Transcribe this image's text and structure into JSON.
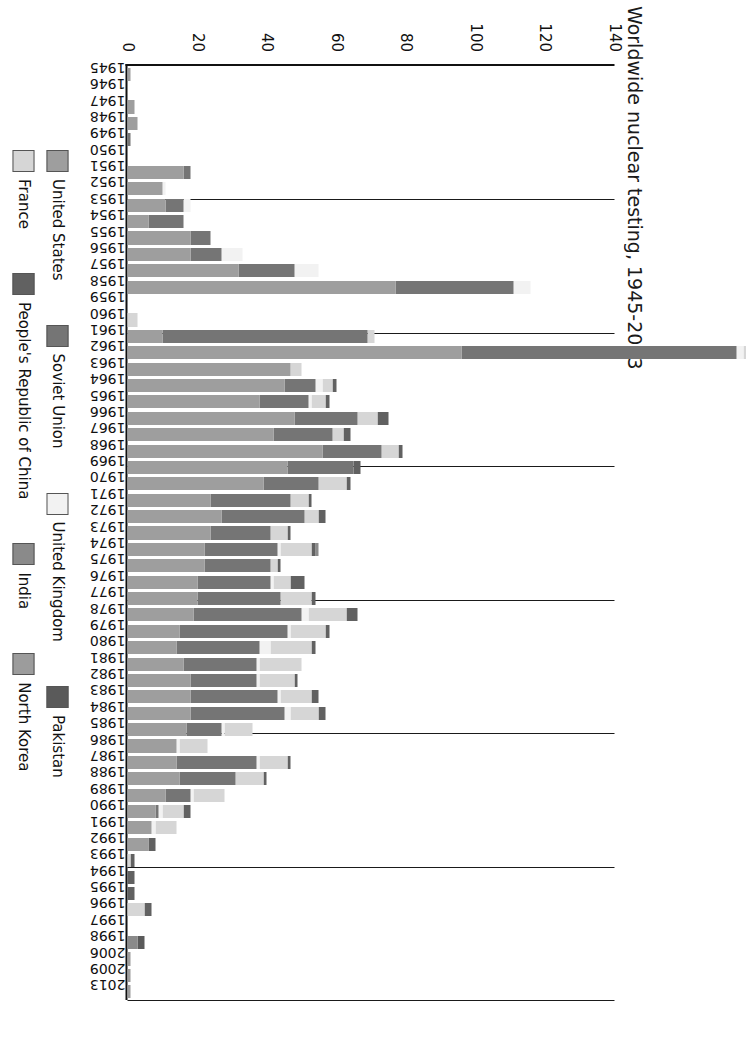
{
  "chart_data": {
    "type": "bar",
    "title": "Worldwide nuclear testing, 1945-2013",
    "subtitle": "",
    "xlabel": "",
    "ylabel": "",
    "ylim": [
      0,
      140
    ],
    "yticks": [
      0,
      20,
      40,
      60,
      80,
      100,
      120,
      140
    ],
    "ytick_labels": [
      "0",
      "20",
      "40",
      "60",
      "80",
      "100",
      "120",
      "140"
    ],
    "grid": true,
    "stacked": true,
    "orientation": "rotated-90-clockwise",
    "legend_position": "bottom",
    "legend": [
      "United States",
      "Soviet Union",
      "United Kingdom",
      "Pakistan",
      "France",
      "People's Republic of China",
      "India",
      "North Korea"
    ],
    "series_colors": {
      "United States": "#9e9e9e",
      "Soviet Union": "#757575",
      "United Kingdom": "#f2f2f2",
      "Pakistan": "#5a5a5a",
      "France": "#d6d6d6",
      "People's Republic of China": "#616161",
      "India": "#8a8a8a",
      "North Korea": "#9c9c9c"
    },
    "categories": [
      "1945",
      "1946",
      "1947",
      "1948",
      "1949",
      "1950",
      "1951",
      "1952",
      "1953",
      "1954",
      "1955",
      "1956",
      "1957",
      "1958",
      "1959",
      "1960",
      "1961",
      "1962",
      "1963",
      "1964",
      "1965",
      "1966",
      "1967",
      "1968",
      "1969",
      "1970",
      "1971",
      "1972",
      "1973",
      "1974",
      "1975",
      "1976",
      "1977",
      "1978",
      "1979",
      "1980",
      "1981",
      "1982",
      "1983",
      "1984",
      "1985",
      "1986",
      "1987",
      "1988",
      "1989",
      "1990",
      "1991",
      "1992",
      "1993",
      "1994",
      "1995",
      "1996",
      "1997",
      "1998",
      "2006",
      "2009",
      "2013"
    ],
    "series": [
      {
        "name": "United States",
        "values": [
          1,
          0,
          2,
          3,
          0,
          0,
          16,
          10,
          11,
          6,
          18,
          18,
          32,
          77,
          0,
          0,
          10,
          96,
          47,
          45,
          38,
          48,
          42,
          56,
          46,
          39,
          24,
          27,
          24,
          22,
          22,
          20,
          20,
          19,
          15,
          14,
          16,
          18,
          18,
          18,
          17,
          14,
          14,
          15,
          11,
          8,
          7,
          6,
          0,
          0,
          0,
          0,
          0,
          0,
          0,
          0,
          0
        ]
      },
      {
        "name": "Soviet Union",
        "values": [
          0,
          0,
          0,
          0,
          1,
          0,
          2,
          0,
          5,
          10,
          6,
          9,
          16,
          34,
          0,
          0,
          59,
          79,
          0,
          9,
          14,
          18,
          17,
          17,
          19,
          16,
          23,
          24,
          17,
          21,
          19,
          21,
          24,
          31,
          31,
          24,
          21,
          19,
          25,
          27,
          10,
          0,
          23,
          16,
          7,
          1,
          0,
          0,
          0,
          0,
          0,
          0,
          0,
          0,
          0,
          0,
          0
        ]
      },
      {
        "name": "United Kingdom",
        "values": [
          0,
          0,
          0,
          0,
          0,
          0,
          0,
          1,
          2,
          0,
          0,
          6,
          7,
          5,
          0,
          0,
          0,
          2,
          0,
          2,
          1,
          0,
          0,
          0,
          0,
          0,
          0,
          0,
          0,
          1,
          0,
          1,
          0,
          2,
          1,
          3,
          1,
          1,
          1,
          2,
          1,
          1,
          1,
          0,
          1,
          1,
          1,
          0,
          0,
          0,
          0,
          0,
          0,
          0,
          0,
          0,
          0
        ]
      },
      {
        "name": "France",
        "values": [
          0,
          0,
          0,
          0,
          0,
          0,
          0,
          0,
          0,
          0,
          0,
          0,
          0,
          0,
          0,
          3,
          2,
          1,
          3,
          3,
          4,
          6,
          3,
          5,
          0,
          8,
          5,
          4,
          5,
          9,
          2,
          5,
          9,
          11,
          10,
          12,
          12,
          10,
          9,
          8,
          8,
          8,
          8,
          8,
          9,
          6,
          6,
          0,
          1,
          0,
          0,
          5,
          0,
          0,
          0,
          0,
          0
        ]
      },
      {
        "name": "People's Republic of China",
        "values": [
          0,
          0,
          0,
          0,
          0,
          0,
          0,
          0,
          0,
          0,
          0,
          0,
          0,
          0,
          0,
          0,
          0,
          0,
          0,
          1,
          1,
          3,
          2,
          1,
          2,
          1,
          1,
          2,
          1,
          1,
          1,
          4,
          1,
          3,
          1,
          1,
          0,
          1,
          2,
          2,
          0,
          0,
          1,
          1,
          0,
          2,
          0,
          2,
          1,
          2,
          2,
          2,
          0,
          0,
          0,
          0,
          0
        ]
      },
      {
        "name": "India",
        "values": [
          0,
          0,
          0,
          0,
          0,
          0,
          0,
          0,
          0,
          0,
          0,
          0,
          0,
          0,
          0,
          0,
          0,
          0,
          0,
          0,
          0,
          0,
          0,
          0,
          0,
          0,
          0,
          0,
          0,
          1,
          0,
          0,
          0,
          0,
          0,
          0,
          0,
          0,
          0,
          0,
          0,
          0,
          0,
          0,
          0,
          0,
          0,
          0,
          0,
          0,
          0,
          0,
          0,
          3,
          0,
          0,
          0
        ]
      },
      {
        "name": "Pakistan",
        "values": [
          0,
          0,
          0,
          0,
          0,
          0,
          0,
          0,
          0,
          0,
          0,
          0,
          0,
          0,
          0,
          0,
          0,
          0,
          0,
          0,
          0,
          0,
          0,
          0,
          0,
          0,
          0,
          0,
          0,
          0,
          0,
          0,
          0,
          0,
          0,
          0,
          0,
          0,
          0,
          0,
          0,
          0,
          0,
          0,
          0,
          0,
          0,
          0,
          0,
          0,
          0,
          0,
          0,
          2,
          0,
          0,
          0
        ]
      },
      {
        "name": "North Korea",
        "values": [
          0,
          0,
          0,
          0,
          0,
          0,
          0,
          0,
          0,
          0,
          0,
          0,
          0,
          0,
          0,
          0,
          0,
          0,
          0,
          0,
          0,
          0,
          0,
          0,
          0,
          0,
          0,
          0,
          0,
          0,
          0,
          0,
          0,
          0,
          0,
          0,
          0,
          0,
          0,
          0,
          0,
          0,
          0,
          0,
          0,
          0,
          0,
          0,
          0,
          0,
          0,
          0,
          0,
          0,
          1,
          1,
          1
        ]
      }
    ]
  }
}
